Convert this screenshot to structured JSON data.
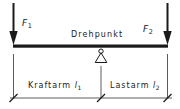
{
  "diagram": {
    "colors": {
      "ink": "#1a1a1a",
      "thin": "#4a4a4a",
      "background": "#ffffff"
    },
    "labels": {
      "force_left": "F",
      "force_left_sub": "1",
      "force_right": "F",
      "force_right_sub": "2",
      "pivot": "Drehpunkt",
      "arm_left": "Kraftarm",
      "arm_left_sym": "l",
      "arm_left_sub": "1",
      "arm_right": "Lastarm",
      "arm_right_sym": "l",
      "arm_right_sub": "2"
    },
    "geometry": {
      "beam_left_x": 13,
      "beam_right_x": 168,
      "beam_y": 46,
      "pivot_x": 101,
      "dimension_line_y": 98
    }
  }
}
